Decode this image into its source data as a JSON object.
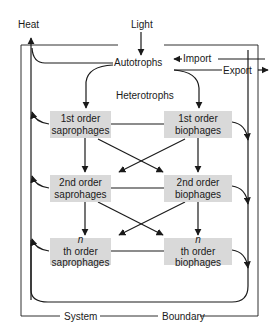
{
  "diagram": {
    "labels": {
      "heat": "Heat",
      "light": "Light",
      "autotrophs": "Autotrophs",
      "import": "Import",
      "export": "Export",
      "heterotrophs": "Heterotrophs",
      "system": "System",
      "boundary": "Boundary"
    },
    "boxes": [
      {
        "id": "sap1",
        "line1_prefix": "",
        "line1_rest": "1st order",
        "line2": "saprophages"
      },
      {
        "id": "bio1",
        "line1_prefix": "",
        "line1_rest": "1st order",
        "line2": "biophages"
      },
      {
        "id": "sap2",
        "line1_prefix": "",
        "line1_rest": "2nd order",
        "line2": "saprohages"
      },
      {
        "id": "bio2",
        "line1_prefix": "",
        "line1_rest": "2nd order",
        "line2": "biophages"
      },
      {
        "id": "sapn",
        "line1_prefix": "n",
        "line1_rest": "th order",
        "line2": "saprophages"
      },
      {
        "id": "bion",
        "line1_prefix": "n",
        "line1_rest": "th order",
        "line2": "biophages"
      }
    ],
    "colors": {
      "box_fill": "#d9d9d9",
      "line": "#1a1a1a",
      "background": "#ffffff"
    }
  }
}
